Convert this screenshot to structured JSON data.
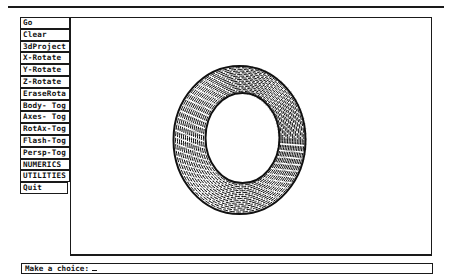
{
  "menu": {
    "items": [
      {
        "label": "Go"
      },
      {
        "label": "Clear"
      },
      {
        "label": "3dProject"
      },
      {
        "label": "X-Rotate"
      },
      {
        "label": "Y-Rotate"
      },
      {
        "label": "Z-Rotate"
      },
      {
        "label": "EraseRota"
      },
      {
        "label": "Body- Tog"
      },
      {
        "label": "Axes- Tog"
      },
      {
        "label": "RotAx-Tog"
      },
      {
        "label": "Flash-Tog"
      },
      {
        "label": "Persp-Tog"
      },
      {
        "label": "NUMERICS"
      },
      {
        "label": "UTILITIES"
      },
      {
        "label": "Quit"
      }
    ]
  },
  "canvas": {
    "object": "torus-wireframe",
    "stroke_color": "#111111",
    "background": "#ffffff"
  },
  "prompt": {
    "text": "Make a choice:",
    "cursor": "_"
  }
}
